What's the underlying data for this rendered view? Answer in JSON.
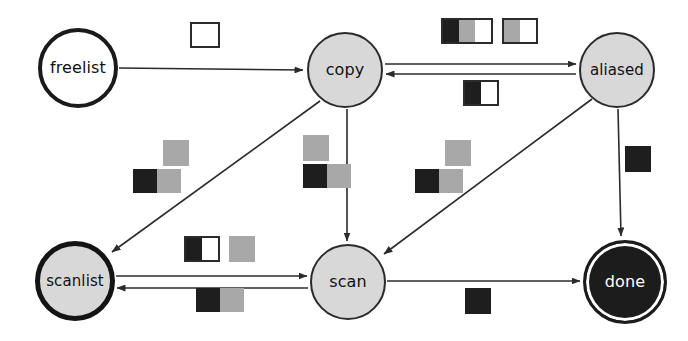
{
  "diagram": {
    "width": 688,
    "height": 341,
    "colors": {
      "background": "#ffffff",
      "stroke": "#2b2b2b",
      "node_fill_gray": "#d8d8d8",
      "node_fill_white": "#ffffff",
      "node_fill_final": "#1c1c1c",
      "cell_black": "#1e1e1e",
      "cell_gray": "#a8a8a8",
      "cell_white": "#ffffff"
    },
    "nodes": [
      {
        "id": "freelist",
        "label": "freelist",
        "x": 78,
        "y": 68,
        "r": 40,
        "style": "plain",
        "font_size": 16
      },
      {
        "id": "copy",
        "label": "copy",
        "x": 345,
        "y": 70,
        "r": 38,
        "style": "gray-thin",
        "font_size": 16
      },
      {
        "id": "aliased",
        "label": "aliased",
        "x": 617,
        "y": 70,
        "r": 38,
        "style": "gray-thin",
        "font_size": 15
      },
      {
        "id": "scanlist",
        "label": "scanlist",
        "x": 75,
        "y": 281,
        "r": 40,
        "style": "gray-thick",
        "font_size": 15
      },
      {
        "id": "scan",
        "label": "scan",
        "x": 348,
        "y": 282,
        "r": 38,
        "style": "gray-thin",
        "font_size": 16
      },
      {
        "id": "done",
        "label": "done",
        "x": 625,
        "y": 282,
        "r": 42,
        "style": "final",
        "font_size": 16
      }
    ],
    "edges": [
      {
        "id": "freelist-to-copy",
        "from": "freelist",
        "to": "copy",
        "label_id": "label-freelist-copy"
      },
      {
        "id": "copy-to-aliased",
        "from": "copy",
        "to": "aliased",
        "label_id": "label-copy-aliased-top"
      },
      {
        "id": "aliased-to-copy",
        "from": "aliased",
        "to": "copy",
        "label_id": "label-copy-aliased-bottom"
      },
      {
        "id": "copy-to-scanlist",
        "from": "copy",
        "to": "scanlist",
        "label_id": "label-copy-scanlist"
      },
      {
        "id": "copy-to-scan",
        "from": "copy",
        "to": "scan",
        "label_id": "label-copy-scan"
      },
      {
        "id": "aliased-to-scan",
        "from": "aliased",
        "to": "scan",
        "label_id": "label-aliased-scan"
      },
      {
        "id": "aliased-to-done",
        "from": "aliased",
        "to": "done",
        "label_id": "label-aliased-done"
      },
      {
        "id": "scanlist-to-scan",
        "from": "scanlist",
        "to": "scan",
        "label_id": "label-scanlist-scan-top"
      },
      {
        "id": "scan-to-scanlist",
        "from": "scan",
        "to": "scanlist",
        "label_id": "label-scanlist-scan-bottom"
      },
      {
        "id": "scan-to-done",
        "from": "scan",
        "to": "done",
        "label_id": "label-scan-done"
      }
    ],
    "labels": [
      {
        "id": "label-freelist-copy",
        "x": 190,
        "y": 22,
        "rows": [
          {
            "groups": [
              {
                "outlined": true,
                "cells": [
                  "white"
                ],
                "shape": "sq"
              }
            ]
          }
        ]
      },
      {
        "id": "label-copy-aliased-top",
        "x": 441,
        "y": 18,
        "rows": [
          {
            "groups": [
              {
                "outlined": true,
                "cells": [
                  "black",
                  "gray",
                  "white"
                ],
                "shape": "tall"
              },
              {
                "outlined": true,
                "cells": [
                  "gray",
                  "white"
                ],
                "shape": "tall"
              }
            ]
          }
        ]
      },
      {
        "id": "label-copy-aliased-bottom",
        "x": 463,
        "y": 80,
        "rows": [
          {
            "groups": [
              {
                "outlined": true,
                "cells": [
                  "black",
                  "white"
                ],
                "shape": "tall"
              }
            ]
          }
        ]
      },
      {
        "id": "label-copy-scanlist",
        "x": 133,
        "y": 140,
        "rows": [
          {
            "indent": 30,
            "groups": [
              {
                "outlined": false,
                "cells": [
                  "gray"
                ],
                "shape": "sq"
              }
            ]
          },
          {
            "indent": 0,
            "groups": [
              {
                "outlined": false,
                "cells": [
                  "black",
                  "gray"
                ],
                "shape": "sq-sm"
              }
            ]
          }
        ]
      },
      {
        "id": "label-copy-scan",
        "x": 303,
        "y": 135,
        "rows": [
          {
            "indent": 0,
            "groups": [
              {
                "outlined": false,
                "cells": [
                  "gray"
                ],
                "shape": "sq"
              }
            ]
          },
          {
            "indent": 0,
            "groups": [
              {
                "outlined": false,
                "cells": [
                  "black",
                  "gray"
                ],
                "shape": "sq-sm"
              }
            ]
          }
        ]
      },
      {
        "id": "label-aliased-scan",
        "x": 415,
        "y": 140,
        "rows": [
          {
            "indent": 30,
            "groups": [
              {
                "outlined": false,
                "cells": [
                  "gray"
                ],
                "shape": "sq"
              }
            ]
          },
          {
            "indent": 0,
            "groups": [
              {
                "outlined": false,
                "cells": [
                  "black",
                  "gray"
                ],
                "shape": "sq-sm"
              }
            ]
          }
        ]
      },
      {
        "id": "label-aliased-done",
        "x": 625,
        "y": 146,
        "rows": [
          {
            "groups": [
              {
                "outlined": false,
                "cells": [
                  "black"
                ],
                "shape": "sq"
              }
            ]
          }
        ]
      },
      {
        "id": "label-scanlist-scan-top",
        "x": 184,
        "y": 236,
        "rows": [
          {
            "groups": [
              {
                "outlined": true,
                "cells": [
                  "black",
                  "white"
                ],
                "shape": "tall"
              },
              {
                "outlined": false,
                "cells": [
                  "gray"
                ],
                "shape": "sq"
              }
            ]
          }
        ]
      },
      {
        "id": "label-scanlist-scan-bottom",
        "x": 196,
        "y": 288,
        "rows": [
          {
            "groups": [
              {
                "outlined": false,
                "cells": [
                  "black",
                  "gray"
                ],
                "shape": "sq-sm"
              }
            ]
          }
        ]
      },
      {
        "id": "label-scan-done",
        "x": 465,
        "y": 288,
        "rows": [
          {
            "groups": [
              {
                "outlined": false,
                "cells": [
                  "black"
                ],
                "shape": "sq"
              }
            ]
          }
        ]
      }
    ]
  }
}
